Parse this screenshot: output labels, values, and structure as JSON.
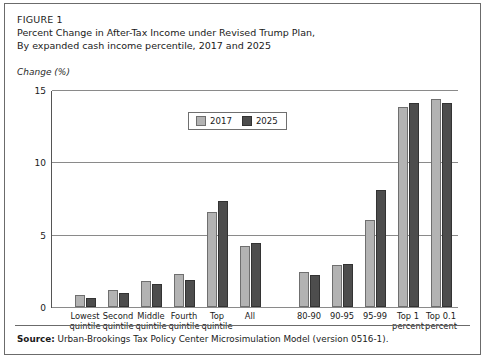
{
  "figure": {
    "label": "FIGURE 1",
    "title_line1": "Percent Change in After-Tax Income under Revised Trump Plan,",
    "title_line2": "By expanded cash income percentile, 2017 and 2025",
    "axis_units": "Change (%)",
    "source_prefix": "Source:",
    "source_text": " Urban-Brookings Tax Policy Center Microsimulation Model (version 0516-1)."
  },
  "legend": {
    "entries": [
      {
        "label": "2017",
        "color": "#b3b3b3"
      },
      {
        "label": "2025",
        "color": "#4d4d4d"
      }
    ]
  },
  "chart_data": {
    "type": "bar",
    "title": "Percent Change in After-Tax Income under Revised Trump Plan, By expanded cash income percentile, 2017 and 2025",
    "xlabel": "",
    "ylabel": "Change (%)",
    "ylim": [
      0,
      15
    ],
    "yticks": [
      0,
      5,
      10,
      15
    ],
    "ytick_labels": [
      "0",
      "5",
      "10",
      "15"
    ],
    "grid": "horizontal",
    "legend_position": "top-center",
    "categories": [
      "Lowest quintile",
      "Second quintile",
      "Middle quintile",
      "Fourth quintile",
      "Top quintile",
      "All",
      "80-90",
      "90-95",
      "95-99",
      "Top 1 percent",
      "Top 0.1 percent"
    ],
    "category_labels": [
      [
        "Lowest",
        "quintile"
      ],
      [
        "Second",
        "quintile"
      ],
      [
        "Middle",
        "quintile"
      ],
      [
        "Fourth",
        "quintile"
      ],
      [
        "Top",
        "quintile"
      ],
      [
        "All",
        ""
      ],
      [
        "80-90",
        ""
      ],
      [
        "90-95",
        ""
      ],
      [
        "95-99",
        ""
      ],
      [
        "Top 1",
        "percent"
      ],
      [
        "Top 0.1",
        "percent"
      ]
    ],
    "series": [
      {
        "name": "2017",
        "color": "#b3b3b3",
        "values": [
          0.8,
          1.2,
          1.8,
          2.3,
          6.6,
          4.2,
          2.4,
          2.9,
          6.0,
          13.8,
          14.4
        ]
      },
      {
        "name": "2025",
        "color": "#4d4d4d",
        "values": [
          0.6,
          1.0,
          1.6,
          1.9,
          7.3,
          4.4,
          2.2,
          3.0,
          8.1,
          14.1,
          14.1
        ]
      }
    ]
  }
}
